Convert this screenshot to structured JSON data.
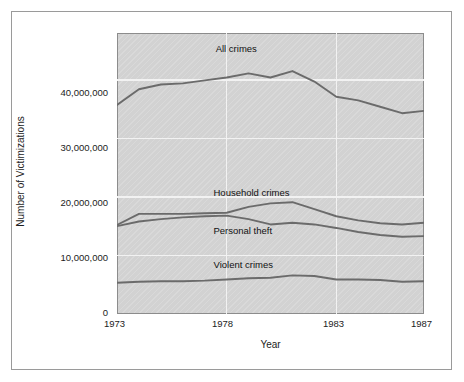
{
  "chart_data": {
    "type": "line",
    "title": "",
    "xlabel": "Year",
    "ylabel": "Number of Victimizations",
    "xlim": [
      1973,
      1987
    ],
    "ylim": [
      0,
      48000000
    ],
    "grid": true,
    "legend_position": "inline-labels",
    "x_tick_labels": [
      "1973",
      "1978",
      "1983",
      "1987"
    ],
    "x_tick_values": [
      1973,
      1978,
      1983,
      1987
    ],
    "y_tick_labels": [
      "0",
      "10,000,000",
      "20,000,000",
      "30,000,000",
      "40,000,000"
    ],
    "y_tick_values": [
      0,
      10000000,
      20000000,
      30000000,
      40000000
    ],
    "x": [
      1973,
      1974,
      1975,
      1976,
      1977,
      1978,
      1979,
      1980,
      1981,
      1982,
      1983,
      1984,
      1985,
      1986,
      1987
    ],
    "series": [
      {
        "name": "All crimes",
        "label": "All crimes",
        "color": "#6b6b6b",
        "values": [
          35700000,
          38400000,
          39200000,
          39400000,
          39900000,
          40400000,
          41100000,
          40400000,
          41500000,
          39700000,
          37100000,
          36500000,
          35400000,
          34300000,
          34700000
        ]
      },
      {
        "name": "Household crimes",
        "label": "Household crimes",
        "color": "#6b6b6b",
        "values": [
          15200000,
          17100000,
          17100000,
          17100000,
          17200000,
          17300000,
          18300000,
          18900000,
          19100000,
          17900000,
          16700000,
          16000000,
          15500000,
          15300000,
          15600000
        ]
      },
      {
        "name": "Personal theft",
        "label": "Personal theft",
        "color": "#6b6b6b",
        "values": [
          15000000,
          15800000,
          16200000,
          16500000,
          16700000,
          16800000,
          16200000,
          15300000,
          15600000,
          15300000,
          14700000,
          14000000,
          13500000,
          13200000,
          13300000
        ]
      },
      {
        "name": "Violent crimes",
        "label": "Violent crimes",
        "color": "#6b6b6b",
        "values": [
          5350000,
          5500000,
          5600000,
          5600000,
          5700000,
          5900000,
          6100000,
          6200000,
          6600000,
          6500000,
          5900000,
          5900000,
          5800000,
          5500000,
          5600000
        ]
      }
    ],
    "series_label_positions": [
      {
        "name": "All crimes",
        "x": 1977.5,
        "y": 45300000
      },
      {
        "name": "Household crimes",
        "x": 1977.4,
        "y": 20600000
      },
      {
        "name": "Personal theft",
        "x": 1977.4,
        "y": 14200000
      },
      {
        "name": "Violent crimes",
        "x": 1977.4,
        "y": 8300000
      }
    ],
    "colors": {
      "plot_background": "#d2d2d2",
      "plot_border": "#8c8c8c",
      "gridline": "#f2f2f2",
      "line": "#6b6b6b",
      "frame": "#9a9a9a",
      "text": "#1c1c1c",
      "page_background": "#ffffff"
    }
  }
}
